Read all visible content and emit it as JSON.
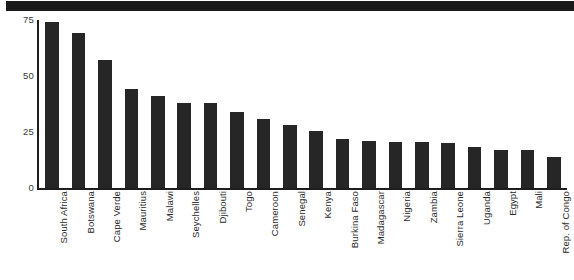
{
  "figure": {
    "header_band_color": "#1a1a1a",
    "background_color": "#ffffff",
    "bar_color": "#262626",
    "axis_color": "#1e1e1e",
    "tick_label_color": "#3a3a3a"
  },
  "chart_data": {
    "type": "bar",
    "title": "",
    "subtitle": "",
    "xlabel": "",
    "ylabel": "",
    "orientation": "vertical",
    "grid": false,
    "legend": false,
    "legend_position": "none",
    "ylim": [
      0,
      75
    ],
    "yticks": [
      0,
      25,
      50,
      75
    ],
    "ytick_labels": [
      "0",
      "25",
      "50",
      "75"
    ],
    "categories": [
      "South Africa",
      "Botswana",
      "Cape Verde",
      "Mauritius",
      "Malawi",
      "Seychelles",
      "Djibouti",
      "Togo",
      "Cameroon",
      "Senegal",
      "Kenya",
      "Burkina Faso",
      "Madagascar",
      "Nigeria",
      "Zambia",
      "Sierra Leone",
      "Uganda",
      "Egypt",
      "Mali",
      "Rep. of Congo"
    ],
    "values": [
      74,
      69,
      57,
      44,
      41,
      38,
      38,
      34,
      31,
      28,
      25.5,
      22,
      21,
      20.5,
      20.5,
      20,
      18.5,
      17,
      17,
      14
    ],
    "series": [
      {
        "name": "",
        "values": [
          74,
          69,
          57,
          44,
          41,
          38,
          38,
          34,
          31,
          28,
          25.5,
          22,
          21,
          20.5,
          20.5,
          20,
          18.5,
          17,
          17,
          14
        ]
      }
    ]
  }
}
